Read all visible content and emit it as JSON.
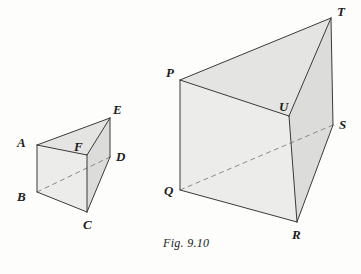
{
  "figure": {
    "caption": "Fig. 9.10",
    "caption_pos": {
      "x": 163,
      "y": 236
    },
    "background_color": "#fdfdfb",
    "face_fill_light": "#ececeb",
    "face_fill_mid": "#e4e4e2",
    "face_fill_dark": "#dcdcda",
    "edge_color": "#3a3a3a",
    "hidden_edge_color": "#8a8a8a",
    "label_color": "#1b1b1b"
  },
  "shapes": [
    {
      "name": "small-triangular-prism",
      "vertices": {
        "A": {
          "x": 37,
          "y": 145
        },
        "B": {
          "x": 37,
          "y": 192
        },
        "C": {
          "x": 87,
          "y": 212
        },
        "D": {
          "x": 110,
          "y": 157
        },
        "E": {
          "x": 110,
          "y": 118
        },
        "F": {
          "x": 87,
          "y": 155
        }
      },
      "labels": [
        {
          "text": "A",
          "x": 17,
          "y": 136
        },
        {
          "text": "B",
          "x": 17,
          "y": 190
        },
        {
          "text": "C",
          "x": 83,
          "y": 218
        },
        {
          "text": "D",
          "x": 116,
          "y": 150
        },
        {
          "text": "E",
          "x": 113,
          "y": 103
        },
        {
          "text": "F",
          "x": 74,
          "y": 140
        }
      ],
      "faces": [
        {
          "name": "front-face-ABCF",
          "points": "37,145 37,192 87,212 87,155",
          "fill": "#ececeb"
        },
        {
          "name": "top-face-AFE",
          "points": "37,145 87,155 110,118",
          "fill": "#e4e4e2"
        },
        {
          "name": "right-face-FCDE-visible",
          "points": "87,155 87,212 110,157 110,118",
          "fill": "#dcdcda"
        }
      ],
      "solid_edges": [
        {
          "name": "edge-AB",
          "x1": 37,
          "y1": 145,
          "x2": 37,
          "y2": 192
        },
        {
          "name": "edge-BC",
          "x1": 37,
          "y1": 192,
          "x2": 87,
          "y2": 212
        },
        {
          "name": "edge-CF",
          "x1": 87,
          "y1": 212,
          "x2": 87,
          "y2": 155
        },
        {
          "name": "edge-AF",
          "x1": 37,
          "y1": 145,
          "x2": 87,
          "y2": 155
        },
        {
          "name": "edge-AE",
          "x1": 37,
          "y1": 145,
          "x2": 110,
          "y2": 118
        },
        {
          "name": "edge-FE",
          "x1": 87,
          "y1": 155,
          "x2": 110,
          "y2": 118
        },
        {
          "name": "edge-ED",
          "x1": 110,
          "y1": 118,
          "x2": 110,
          "y2": 157
        },
        {
          "name": "edge-CD",
          "x1": 87,
          "y1": 212,
          "x2": 110,
          "y2": 157
        }
      ],
      "hidden_edges": [
        {
          "name": "hidden-edge-BD",
          "x1": 37,
          "y1": 192,
          "x2": 110,
          "y2": 157
        }
      ]
    },
    {
      "name": "large-triangular-prism",
      "vertices": {
        "P": {
          "x": 180,
          "y": 80
        },
        "Q": {
          "x": 180,
          "y": 190
        },
        "R": {
          "x": 297,
          "y": 222
        },
        "S": {
          "x": 333,
          "y": 125
        },
        "T": {
          "x": 331,
          "y": 18
        },
        "U": {
          "x": 289,
          "y": 116
        }
      },
      "labels": [
        {
          "text": "P",
          "x": 166,
          "y": 66
        },
        {
          "text": "Q",
          "x": 164,
          "y": 184
        },
        {
          "text": "R",
          "x": 292,
          "y": 228
        },
        {
          "text": "S",
          "x": 339,
          "y": 118
        },
        {
          "text": "T",
          "x": 337,
          "y": 5
        },
        {
          "text": "U",
          "x": 279,
          "y": 100
        }
      ],
      "faces": [
        {
          "name": "front-face-PQRU",
          "points": "180,80 180,190 297,222 289,116",
          "fill": "#ececeb"
        },
        {
          "name": "top-face-PUT",
          "points": "180,80 289,116 331,18",
          "fill": "#e4e4e2"
        },
        {
          "name": "right-face-URST-visible",
          "points": "289,116 297,222 333,125 331,18",
          "fill": "#dcdcda"
        }
      ],
      "solid_edges": [
        {
          "name": "edge-PQ",
          "x1": 180,
          "y1": 80,
          "x2": 180,
          "y2": 190
        },
        {
          "name": "edge-QR",
          "x1": 180,
          "y1": 190,
          "x2": 297,
          "y2": 222
        },
        {
          "name": "edge-RU",
          "x1": 297,
          "y1": 222,
          "x2": 289,
          "y2": 116
        },
        {
          "name": "edge-PU",
          "x1": 180,
          "y1": 80,
          "x2": 289,
          "y2": 116
        },
        {
          "name": "edge-PT",
          "x1": 180,
          "y1": 80,
          "x2": 331,
          "y2": 18
        },
        {
          "name": "edge-UT",
          "x1": 289,
          "y1": 116,
          "x2": 331,
          "y2": 18
        },
        {
          "name": "edge-TS",
          "x1": 331,
          "y1": 18,
          "x2": 333,
          "y2": 125
        },
        {
          "name": "edge-RS",
          "x1": 297,
          "y1": 222,
          "x2": 333,
          "y2": 125
        }
      ],
      "hidden_edges": [
        {
          "name": "hidden-edge-QS",
          "x1": 180,
          "y1": 190,
          "x2": 333,
          "y2": 125
        }
      ]
    }
  ]
}
